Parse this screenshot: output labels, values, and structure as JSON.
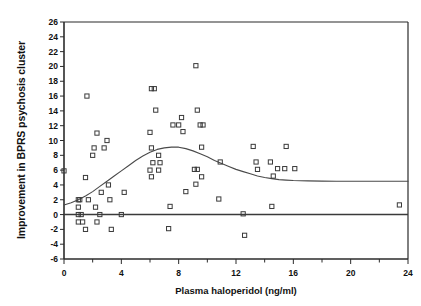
{
  "chart_data": {
    "type": "scatter",
    "title": "",
    "xlabel": "Plasma haloperidol (ng/ml)",
    "ylabel": "Improvement in BPRS psychosis cluster",
    "xlim": [
      0,
      24
    ],
    "ylim": [
      -6,
      26
    ],
    "xticks": [
      0,
      4,
      8,
      12,
      16,
      20,
      24
    ],
    "xtick_labels": [
      "0",
      "4",
      "8",
      "12",
      "16",
      "20",
      "24"
    ],
    "xminor_step": 2,
    "yticks": [
      -6,
      -4,
      -2,
      0,
      2,
      4,
      6,
      8,
      10,
      12,
      14,
      16,
      18,
      20,
      22,
      24,
      26
    ],
    "ytick_labels": [
      "-6",
      "-4",
      "-2",
      "0",
      "2",
      "4",
      "6",
      "8",
      "10",
      "12",
      "14",
      "16",
      "18",
      "20",
      "22",
      "24",
      "26"
    ],
    "grid": false,
    "legend": false,
    "marker": "open-square",
    "marker_color": "#3a3a3a",
    "series": [
      {
        "name": "Patients",
        "points": [
          [
            0.0,
            5.9
          ],
          [
            1.0,
            2.0
          ],
          [
            1.1,
            2.0
          ],
          [
            1.0,
            1.0
          ],
          [
            1.0,
            0.0
          ],
          [
            1.0,
            -1.0
          ],
          [
            1.3,
            -1.0
          ],
          [
            1.2,
            0.0
          ],
          [
            1.5,
            5.0
          ],
          [
            1.6,
            16.0
          ],
          [
            1.5,
            -2.0
          ],
          [
            1.7,
            2.0
          ],
          [
            2.0,
            8.0
          ],
          [
            2.1,
            9.0
          ],
          [
            2.3,
            11.0
          ],
          [
            2.2,
            1.0
          ],
          [
            2.3,
            -1.0
          ],
          [
            2.5,
            0.0
          ],
          [
            2.6,
            3.0
          ],
          [
            2.8,
            9.0
          ],
          [
            3.0,
            10.0
          ],
          [
            3.1,
            4.0
          ],
          [
            3.2,
            2.0
          ],
          [
            3.3,
            -2.0
          ],
          [
            4.0,
            0.0
          ],
          [
            4.2,
            3.0
          ],
          [
            6.0,
            6.0
          ],
          [
            6.1,
            9.0
          ],
          [
            6.0,
            11.1
          ],
          [
            6.1,
            17.0
          ],
          [
            6.3,
            17.0
          ],
          [
            6.1,
            5.1
          ],
          [
            6.2,
            7.0
          ],
          [
            6.4,
            14.1
          ],
          [
            6.6,
            6.0
          ],
          [
            6.7,
            7.0
          ],
          [
            6.6,
            8.0
          ],
          [
            7.4,
            1.1
          ],
          [
            7.3,
            -1.9
          ],
          [
            7.6,
            12.1
          ],
          [
            8.0,
            12.1
          ],
          [
            8.3,
            11.2
          ],
          [
            8.2,
            13.1
          ],
          [
            8.5,
            3.1
          ],
          [
            9.1,
            6.1
          ],
          [
            9.3,
            6.1
          ],
          [
            9.2,
            4.1
          ],
          [
            9.3,
            14.1
          ],
          [
            9.2,
            20.1
          ],
          [
            9.5,
            12.1
          ],
          [
            9.7,
            12.1
          ],
          [
            9.6,
            9.1
          ],
          [
            9.6,
            5.1
          ],
          [
            10.8,
            2.1
          ],
          [
            10.9,
            7.1
          ],
          [
            12.5,
            0.1
          ],
          [
            12.6,
            -2.8
          ],
          [
            13.2,
            9.2
          ],
          [
            13.4,
            7.1
          ],
          [
            13.5,
            6.1
          ],
          [
            14.5,
            1.1
          ],
          [
            14.4,
            7.1
          ],
          [
            14.6,
            5.2
          ],
          [
            14.9,
            6.2
          ],
          [
            15.4,
            6.2
          ],
          [
            15.5,
            9.2
          ],
          [
            16.1,
            6.2
          ],
          [
            23.4,
            1.3
          ]
        ]
      }
    ],
    "fit_curve": {
      "name": "Smoothed fit",
      "color": "#4a4a4a",
      "points": [
        [
          0.0,
          1.3
        ],
        [
          0.5,
          1.6
        ],
        [
          1.0,
          2.0
        ],
        [
          1.5,
          2.5
        ],
        [
          2.0,
          3.1
        ],
        [
          2.5,
          3.8
        ],
        [
          3.0,
          4.5
        ],
        [
          3.5,
          5.2
        ],
        [
          4.0,
          5.9
        ],
        [
          4.5,
          6.6
        ],
        [
          5.0,
          7.3
        ],
        [
          5.5,
          7.9
        ],
        [
          6.0,
          8.4
        ],
        [
          6.5,
          8.8
        ],
        [
          7.0,
          9.0
        ],
        [
          7.5,
          9.1
        ],
        [
          8.0,
          9.1
        ],
        [
          8.5,
          8.9
        ],
        [
          9.0,
          8.6
        ],
        [
          9.5,
          8.2
        ],
        [
          10.0,
          7.8
        ],
        [
          10.5,
          7.3
        ],
        [
          11.0,
          6.9
        ],
        [
          11.5,
          6.5
        ],
        [
          12.0,
          6.1
        ],
        [
          12.5,
          5.8
        ],
        [
          13.0,
          5.5
        ],
        [
          13.5,
          5.2
        ],
        [
          14.0,
          5.0
        ],
        [
          14.5,
          4.85
        ],
        [
          15.0,
          4.72
        ],
        [
          15.5,
          4.65
        ],
        [
          16.0,
          4.6
        ],
        [
          17.0,
          4.55
        ],
        [
          18.0,
          4.52
        ],
        [
          19.0,
          4.5
        ],
        [
          20.0,
          4.5
        ],
        [
          21.0,
          4.5
        ],
        [
          22.0,
          4.5
        ],
        [
          23.0,
          4.5
        ],
        [
          24.0,
          4.5
        ]
      ]
    },
    "zero_line": {
      "name": "zero-reference-line",
      "y": 0,
      "color": "#3a3a3a"
    },
    "axes": {
      "plot_left_px": 64,
      "plot_right_px": 408,
      "plot_top_px": 22,
      "plot_bottom_px": 259
    }
  }
}
